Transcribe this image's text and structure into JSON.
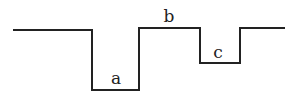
{
  "diagram": {
    "type": "step-profile",
    "line_color": "#222222",
    "path_points": [
      [
        13,
        30
      ],
      [
        92,
        30
      ],
      [
        92,
        90
      ],
      [
        139,
        90
      ],
      [
        139,
        28
      ],
      [
        200,
        28
      ],
      [
        200,
        63
      ],
      [
        240,
        63
      ],
      [
        240,
        28
      ],
      [
        285,
        28
      ]
    ],
    "labels": [
      {
        "id": "a",
        "text": "a",
        "x": 116,
        "y": 84
      },
      {
        "id": "b",
        "text": "b",
        "x": 169,
        "y": 22
      },
      {
        "id": "c",
        "text": "c",
        "x": 218,
        "y": 58
      }
    ]
  }
}
